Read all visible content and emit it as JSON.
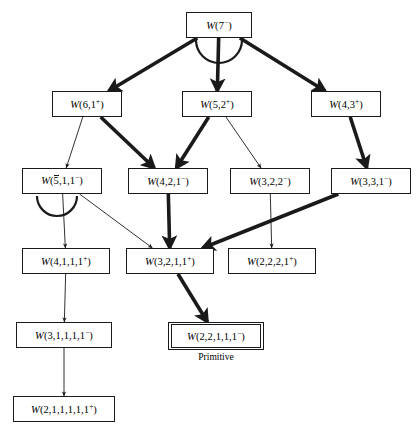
{
  "diagram": {
    "type": "hasse-lattice",
    "title": "",
    "background_color": "#ffffff",
    "line_color": "#1a1a1a",
    "nodes": [
      {
        "id": "n7",
        "label": "W(7⁻)",
        "row": 0,
        "x": 186,
        "y": 12,
        "w": 66,
        "h": 26,
        "primitive": false
      },
      {
        "id": "n61",
        "label": "W(6,1⁺)",
        "row": 1,
        "x": 52,
        "y": 91,
        "w": 70,
        "h": 26,
        "primitive": false
      },
      {
        "id": "n52",
        "label": "W(5,2⁺)",
        "row": 1,
        "x": 182,
        "y": 91,
        "w": 70,
        "h": 26,
        "primitive": false
      },
      {
        "id": "n43",
        "label": "W(4,3⁺)",
        "row": 1,
        "x": 311,
        "y": 91,
        "w": 70,
        "h": 26,
        "primitive": false
      },
      {
        "id": "n511",
        "label": "W(5̄,1,1⁻)",
        "row": 2,
        "x": 22,
        "y": 168,
        "w": 80,
        "h": 26,
        "primitive": false
      },
      {
        "id": "n421",
        "label": "W(4,2,1⁻)",
        "row": 2,
        "x": 128,
        "y": 168,
        "w": 80,
        "h": 26,
        "primitive": false
      },
      {
        "id": "n322",
        "label": "W(3,2,2⁻)",
        "row": 2,
        "x": 230,
        "y": 168,
        "w": 80,
        "h": 26,
        "primitive": false
      },
      {
        "id": "n331",
        "label": "W(3,3,1⁻)",
        "row": 2,
        "x": 331,
        "y": 168,
        "w": 80,
        "h": 26,
        "primitive": false
      },
      {
        "id": "n4111",
        "label": "W(4,1,1,1⁺)",
        "row": 3,
        "x": 22,
        "y": 248,
        "w": 88,
        "h": 26,
        "primitive": false
      },
      {
        "id": "n3211",
        "label": "W(3,2,1,1⁺)",
        "row": 3,
        "x": 126,
        "y": 248,
        "w": 88,
        "h": 26,
        "primitive": false
      },
      {
        "id": "n2221",
        "label": "W(2,2,2,1⁺)",
        "row": 3,
        "x": 228,
        "y": 248,
        "w": 88,
        "h": 26,
        "primitive": false
      },
      {
        "id": "n31111",
        "label": "W(3,1,1,1,1⁻)",
        "row": 4,
        "x": 16,
        "y": 322,
        "w": 96,
        "h": 26,
        "primitive": false
      },
      {
        "id": "n22111",
        "label": "W(2,2,1,1,1⁻)",
        "row": 4,
        "x": 168,
        "y": 322,
        "w": 96,
        "h": 28,
        "primitive": true,
        "caption": "Primitive"
      },
      {
        "id": "n211111",
        "label": "W(2,1,1,1,1,1⁺)",
        "row": 5,
        "x": 13,
        "y": 396,
        "w": 102,
        "h": 26,
        "primitive": false
      }
    ],
    "edges": [
      {
        "from": "n7",
        "to": "n61",
        "weight": "thick"
      },
      {
        "from": "n7",
        "to": "n52",
        "weight": "thick"
      },
      {
        "from": "n7",
        "to": "n43",
        "weight": "thick"
      },
      {
        "from": "n61",
        "to": "n511",
        "weight": "thin"
      },
      {
        "from": "n61",
        "to": "n421",
        "weight": "thick"
      },
      {
        "from": "n52",
        "to": "n421",
        "weight": "thick"
      },
      {
        "from": "n52",
        "to": "n322",
        "weight": "thin"
      },
      {
        "from": "n43",
        "to": "n331",
        "weight": "thick"
      },
      {
        "from": "n511",
        "to": "n4111",
        "weight": "thin"
      },
      {
        "from": "n511",
        "to": "n3211",
        "weight": "thin"
      },
      {
        "from": "n421",
        "to": "n3211",
        "weight": "thick"
      },
      {
        "from": "n322",
        "to": "n2221",
        "weight": "thin"
      },
      {
        "from": "n331",
        "to": "n3211",
        "weight": "thick"
      },
      {
        "from": "n4111",
        "to": "n31111",
        "weight": "thin"
      },
      {
        "from": "n3211",
        "to": "n22111",
        "weight": "thick"
      },
      {
        "from": "n31111",
        "to": "n211111",
        "weight": "thin"
      }
    ],
    "arc_markers": [
      {
        "id": "arc-root",
        "cx": 219,
        "cy": 40,
        "r": 23
      },
      {
        "id": "arc-n511",
        "cx": 57,
        "cy": 196,
        "r": 20
      }
    ]
  }
}
